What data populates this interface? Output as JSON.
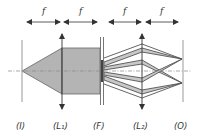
{
  "diagram": {
    "type": "4f optical filtering system",
    "focal_label": "f",
    "spacing_labels": [
      "f",
      "f",
      "f",
      "f"
    ],
    "planes": [
      {
        "id": "I",
        "label": "(I)",
        "role": "input plane"
      },
      {
        "id": "L1",
        "label": "(L₁)",
        "role": "first lens"
      },
      {
        "id": "F",
        "label": "(F)",
        "role": "Fourier filter plane"
      },
      {
        "id": "L2",
        "label": "(L₂)",
        "role": "second lens"
      },
      {
        "id": "O",
        "label": "(O)",
        "role": "output plane"
      }
    ],
    "colors": {
      "beam_fill": "#b4b4b4",
      "line": "#555555",
      "axis": "#888888"
    }
  }
}
